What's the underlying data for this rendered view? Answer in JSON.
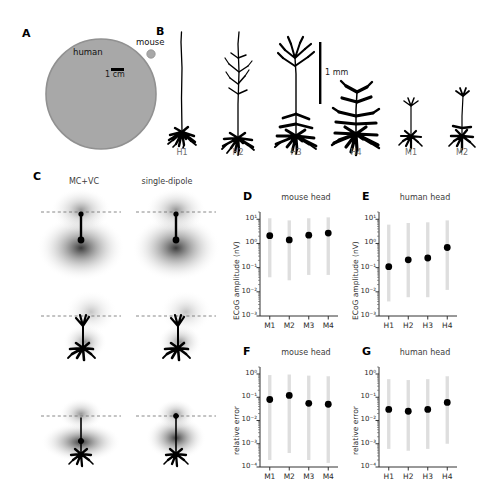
{
  "figure": {
    "panel_letters": [
      "A",
      "B",
      "C",
      "D",
      "E",
      "F",
      "G"
    ]
  },
  "panelA": {
    "letter": "A",
    "human_label": "human",
    "mouse_label": "mouse",
    "scalebar_label": "1 cm",
    "human_color": "#a8a8a8",
    "mouse_color": "#a8a8a8"
  },
  "panelB": {
    "letter": "B",
    "scalebar_label": "1 mm",
    "morphologies": [
      {
        "id": "H1",
        "label": "H1"
      },
      {
        "id": "H2",
        "label": "H2"
      },
      {
        "id": "H3",
        "label": "H3"
      },
      {
        "id": "H4",
        "label": "H4"
      },
      {
        "id": "M1",
        "label": "M1"
      },
      {
        "id": "M2",
        "label": "M2"
      },
      {
        "id": "M3",
        "label": "M3"
      },
      {
        "id": "M4",
        "label": "M4"
      }
    ]
  },
  "panelC": {
    "letter": "C",
    "columns": [
      {
        "label": "MC+VC"
      },
      {
        "label": "single-dipole"
      }
    ],
    "rows": 3
  },
  "chart_data": [
    {
      "panel": "D",
      "letter": "D",
      "type": "scatter",
      "title": "mouse head",
      "xlabel": "",
      "ylabel": "ECoG amplitude (nV)",
      "categories": [
        "M1",
        "M2",
        "M3",
        "M4"
      ],
      "values": [
        2.1,
        1.4,
        2.2,
        2.7
      ],
      "err_low": [
        0.04,
        0.03,
        0.05,
        0.05
      ],
      "err_high": [
        11.0,
        9.0,
        11.0,
        12.0
      ],
      "yscale": "log",
      "ylim": [
        0.001,
        20
      ],
      "yticks": [
        0.001,
        0.01,
        0.1,
        1,
        10
      ],
      "ytick_labels": [
        "10⁻³",
        "10⁻²",
        "10⁻¹",
        "10⁰",
        "10¹"
      ],
      "grid": false,
      "legend": "none"
    },
    {
      "panel": "E",
      "letter": "E",
      "type": "scatter",
      "title": "human head",
      "xlabel": "",
      "ylabel": "ECoG amplitude (nV)",
      "categories": [
        "H1",
        "H2",
        "H3",
        "H4"
      ],
      "values": [
        0.11,
        0.21,
        0.25,
        0.68
      ],
      "err_low": [
        0.004,
        0.006,
        0.006,
        0.012
      ],
      "err_high": [
        6.0,
        7.0,
        7.5,
        9.0
      ],
      "yscale": "log",
      "ylim": [
        0.001,
        20
      ],
      "yticks": [
        0.001,
        0.01,
        0.1,
        1,
        10
      ],
      "ytick_labels": [
        "10⁻³",
        "10⁻²",
        "10⁻¹",
        "10⁰",
        "10¹"
      ],
      "grid": false,
      "legend": "none"
    },
    {
      "panel": "F",
      "letter": "F",
      "type": "scatter",
      "title": "mouse head",
      "xlabel": "",
      "ylabel": "relative error",
      "categories": [
        "M1",
        "M2",
        "M3",
        "M4"
      ],
      "values": [
        0.08,
        0.12,
        0.055,
        0.05
      ],
      "err_low": [
        0.0002,
        0.0004,
        0.0002,
        0.00015
      ],
      "err_high": [
        0.9,
        0.95,
        0.85,
        0.8
      ],
      "yscale": "log",
      "ylim": [
        0.0001,
        2
      ],
      "yticks": [
        0.0001,
        0.001,
        0.01,
        0.1,
        1
      ],
      "ytick_labels": [
        "10⁻⁴",
        "10⁻³",
        "10⁻²",
        "10⁻¹",
        "10⁰"
      ],
      "grid": false,
      "legend": "none"
    },
    {
      "panel": "G",
      "letter": "G",
      "type": "scatter",
      "title": "human head",
      "xlabel": "",
      "ylabel": "relative error",
      "categories": [
        "H1",
        "H2",
        "H3",
        "H4"
      ],
      "values": [
        0.03,
        0.025,
        0.03,
        0.06
      ],
      "err_low": [
        0.0006,
        0.0005,
        0.0006,
        0.001
      ],
      "err_high": [
        0.6,
        0.55,
        0.6,
        0.8
      ],
      "yscale": "log",
      "ylim": [
        0.0001,
        2
      ],
      "yticks": [
        0.0001,
        0.001,
        0.01,
        0.1,
        1
      ],
      "ytick_labels": [
        "10⁻⁴",
        "10⁻³",
        "10⁻²",
        "10⁻¹",
        "10⁰"
      ],
      "grid": false,
      "legend": "none"
    }
  ]
}
